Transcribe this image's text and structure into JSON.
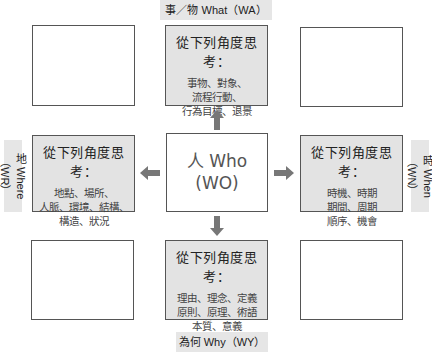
{
  "diagram": {
    "center": {
      "line1": "人 Who",
      "line2": "(WO)"
    },
    "labels": {
      "top": "事／物 What（WA）",
      "bottom": "為何 Why（WY）",
      "left": "地 Where（WR）",
      "right": "時 When（WN）"
    },
    "heading": "從下列角度思考：",
    "boxes": {
      "what": {
        "title": "從下列角度思考：",
        "lines": [
          "事物、對象、",
          "流程行動、",
          "行為目標、退景"
        ]
      },
      "where": {
        "title": "從下列角度思考：",
        "lines": [
          "地點、場所、",
          "人脈、環境、結構、",
          "構造、狀況"
        ]
      },
      "when": {
        "title": "從下列角度思考：",
        "lines": [
          "時機、時期",
          "期間、周期",
          "順序、機會"
        ]
      },
      "why": {
        "title": "從下列角度思考：",
        "lines": [
          "理由、理念、定義",
          "原則、原理、術語",
          "本質、意義"
        ]
      }
    },
    "arrows": [
      "up",
      "down",
      "left",
      "right"
    ],
    "colors": {
      "shaded_box": "#e3e3e3",
      "border": "#555555",
      "arrow": "#777777",
      "label_bg": "#e6e6e6"
    }
  }
}
